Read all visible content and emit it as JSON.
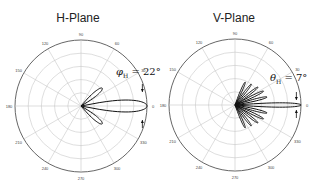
{
  "chart_data": [
    {
      "type": "polar",
      "title": "H-Plane",
      "angular_ticks": [
        "0",
        "30",
        "60",
        "90",
        "120",
        "150",
        "180",
        "210",
        "240",
        "270",
        "300",
        "330"
      ],
      "radial_rings": 5,
      "annotation": "φH = 22°",
      "annotation_label": "φ",
      "annotation_sub": "H",
      "annotation_value": " = 22°",
      "beamwidth_deg": 22,
      "lobes": [
        {
          "angle_deg": 0,
          "length": 1.0,
          "width_deg": 11
        },
        {
          "angle_deg": 40,
          "length": 0.42,
          "width_deg": 9
        },
        {
          "angle_deg": -40,
          "length": 0.42,
          "width_deg": 9
        }
      ]
    },
    {
      "type": "polar",
      "title": "V-Plane",
      "angular_ticks": [
        "0",
        "30",
        "60",
        "90",
        "120",
        "150",
        "180",
        "210",
        "240",
        "270",
        "300",
        "330"
      ],
      "radial_rings": 5,
      "annotation": "θH = 7°",
      "annotation_label": "θ",
      "annotation_sub": "H",
      "annotation_value": " = 7°",
      "beamwidth_deg": 7,
      "lobes": [
        {
          "angle_deg": 0,
          "length": 1.0,
          "width_deg": 4
        },
        {
          "angle_deg": 14,
          "length": 0.5,
          "width_deg": 4
        },
        {
          "angle_deg": -14,
          "length": 0.5,
          "width_deg": 4
        },
        {
          "angle_deg": 26,
          "length": 0.48,
          "width_deg": 4
        },
        {
          "angle_deg": -26,
          "length": 0.48,
          "width_deg": 4
        },
        {
          "angle_deg": 38,
          "length": 0.44,
          "width_deg": 4
        },
        {
          "angle_deg": -38,
          "length": 0.44,
          "width_deg": 4
        },
        {
          "angle_deg": 52,
          "length": 0.4,
          "width_deg": 4
        },
        {
          "angle_deg": -52,
          "length": 0.4,
          "width_deg": 4
        },
        {
          "angle_deg": 66,
          "length": 0.38,
          "width_deg": 4
        },
        {
          "angle_deg": -66,
          "length": 0.38,
          "width_deg": 4
        }
      ]
    }
  ],
  "colors": {
    "grid": "#c8c8c8",
    "outer": "#555555",
    "trace": "#111111",
    "text": "#222222"
  }
}
